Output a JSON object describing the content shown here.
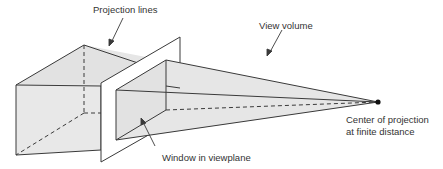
{
  "diagram": {
    "labels": {
      "projection_lines": "Projection lines",
      "view_volume": "View volume",
      "center_line1": "Center of projection",
      "center_line2": "at finite distance",
      "window": "Window in viewplane"
    },
    "colors": {
      "fill": "#e6e6e6",
      "stroke": "#3a3a3a",
      "plane": "#ffffff"
    }
  }
}
